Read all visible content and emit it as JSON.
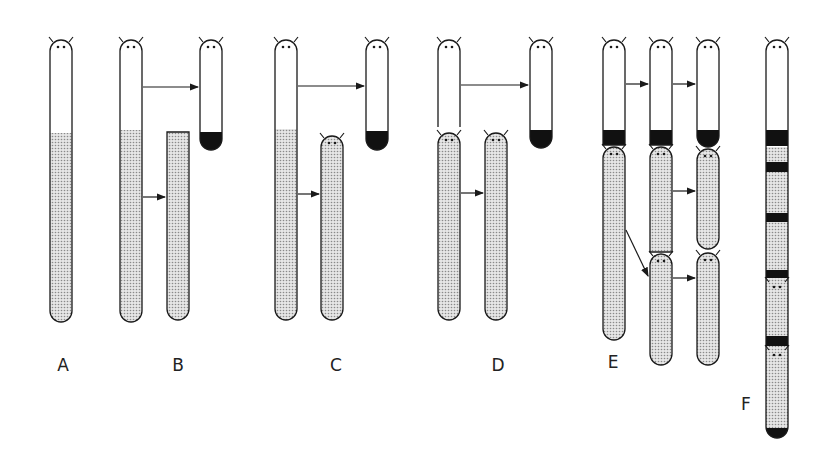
{
  "figure": {
    "colors": {
      "outline": "#1a1a1a",
      "stipple": "#c8c8c8",
      "band": "#111111",
      "background": "#ffffff"
    },
    "panels": [
      {
        "label": "A",
        "label_pos": [
          63,
          371
        ],
        "segments": [
          {
            "x": 50,
            "y1": 40,
            "y2": 322,
            "head": true,
            "stipple_from": 133,
            "bottom": "round"
          }
        ],
        "arrows": []
      },
      {
        "label": "B",
        "label_pos": [
          178,
          371
        ],
        "segments": [
          {
            "x": 120,
            "y1": 40,
            "y2": 322,
            "head": true,
            "stipple_from": 130,
            "bottom": "round"
          },
          {
            "x": 200,
            "y1": 40,
            "y2": 150,
            "head": true,
            "black_bottom_from": 132,
            "bottom": "round"
          },
          {
            "x": 167,
            "y1": 132,
            "y2": 320,
            "head": false,
            "flat_top": true,
            "stipple_from": 132,
            "bottom": "round"
          }
        ],
        "arrows": [
          {
            "x1": 143,
            "y1": 87,
            "x2": 198,
            "y2": 87
          },
          {
            "x1": 143,
            "y1": 197,
            "x2": 165,
            "y2": 197
          }
        ]
      },
      {
        "label": "C",
        "label_pos": [
          336,
          371
        ],
        "segments": [
          {
            "x": 275,
            "y1": 40,
            "y2": 320,
            "head": true,
            "stipple_from": 129,
            "bottom": "round"
          },
          {
            "x": 366,
            "y1": 40,
            "y2": 150,
            "head": true,
            "black_bottom_from": 131,
            "bottom": "round"
          },
          {
            "x": 321,
            "y1": 136,
            "y2": 320,
            "head": true,
            "stipple_from": 136,
            "bottom": "round"
          }
        ],
        "arrows": [
          {
            "x1": 298,
            "y1": 86,
            "x2": 364,
            "y2": 86
          },
          {
            "x1": 298,
            "y1": 194,
            "x2": 319,
            "y2": 194
          }
        ]
      },
      {
        "label": "D",
        "label_pos": [
          498,
          371
        ],
        "segments": [
          {
            "x": 438,
            "y1": 40,
            "y2": 127,
            "head": true,
            "open_bottom": true
          },
          {
            "x": 438,
            "y1": 133,
            "y2": 320,
            "head": true,
            "stipple_from": 133,
            "bottom": "round"
          },
          {
            "x": 530,
            "y1": 40,
            "y2": 148,
            "head": true,
            "black_bottom_from": 130,
            "bottom": "round"
          },
          {
            "x": 485,
            "y1": 133,
            "y2": 320,
            "head": true,
            "stipple_from": 133,
            "bottom": "round"
          }
        ],
        "arrows": [
          {
            "x1": 461,
            "y1": 85,
            "x2": 528,
            "y2": 85
          },
          {
            "x1": 461,
            "y1": 193,
            "x2": 483,
            "y2": 193
          }
        ]
      },
      {
        "label": "E",
        "label_pos": [
          613,
          368
        ],
        "segments": [
          {
            "x": 603,
            "y1": 40,
            "y2": 145,
            "head": true,
            "black_bottom_from": 130,
            "bottom": "flat"
          },
          {
            "x": 603,
            "y1": 147,
            "y2": 340,
            "head": true,
            "stipple_from": 147,
            "bottom": "round"
          },
          {
            "x": 650,
            "y1": 40,
            "y2": 145,
            "head": true,
            "black_bottom_from": 130,
            "bottom": "flat"
          },
          {
            "x": 650,
            "y1": 147,
            "y2": 252,
            "head": true,
            "stipple_from": 147,
            "bottom": "flat"
          },
          {
            "x": 650,
            "y1": 254,
            "y2": 365,
            "head": true,
            "stipple_from": 254,
            "bottom": "round"
          },
          {
            "x": 697,
            "y1": 40,
            "y2": 147,
            "head": true,
            "black_bottom_from": 130,
            "bottom": "round"
          },
          {
            "x": 697,
            "y1": 149,
            "y2": 249,
            "head": true,
            "stipple_from": 149,
            "bottom": "round"
          },
          {
            "x": 697,
            "y1": 253,
            "y2": 365,
            "head": true,
            "stipple_from": 253,
            "bottom": "round"
          }
        ],
        "arrows": [
          {
            "x1": 626,
            "y1": 84,
            "x2": 648,
            "y2": 84
          },
          {
            "x1": 673,
            "y1": 84,
            "x2": 695,
            "y2": 84
          },
          {
            "x1": 673,
            "y1": 191,
            "x2": 695,
            "y2": 191
          },
          {
            "x1": 626,
            "y1": 230,
            "x2": 648,
            "y2": 276
          },
          {
            "x1": 673,
            "y1": 278,
            "x2": 695,
            "y2": 278
          }
        ]
      },
      {
        "label": "F",
        "label_pos": [
          746,
          410
        ],
        "segments": [
          {
            "x": 766,
            "y1": 40,
            "y2": 438,
            "head": true,
            "stipple_from": 147,
            "bottom": "round",
            "bands": [
              [
                130,
                146
              ],
              [
                162,
                172
              ],
              [
                213,
                222
              ],
              [
                270,
                278
              ],
              [
                336,
                346
              ],
              [
                428,
                438
              ]
            ],
            "minor_heads": [
              280,
              348
            ]
          }
        ],
        "arrows": []
      }
    ]
  }
}
